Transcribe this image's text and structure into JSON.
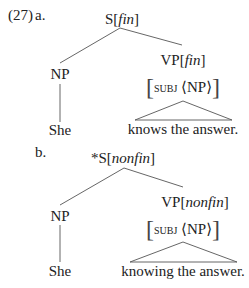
{
  "example": {
    "number": "(27)",
    "a": {
      "label": "a.",
      "root": {
        "cat": "S[",
        "feat": "fin",
        "close": "]"
      },
      "left": {
        "cat": "NP",
        "leaf": "She"
      },
      "right": {
        "cat": "VP[",
        "feat": "fin",
        "close": "]",
        "avm_attr": "subj",
        "avm_val": "⟨NP⟩",
        "leaf": "knows the answer."
      }
    },
    "b": {
      "label": "b.",
      "root": {
        "cat": "*S[",
        "feat": "nonfin",
        "close": "]"
      },
      "left": {
        "cat": "NP",
        "leaf": "She"
      },
      "right": {
        "cat": "VP[",
        "feat": "nonfin",
        "close": "]",
        "avm_attr": "subj",
        "avm_val": "⟨NP⟩",
        "leaf": "knowing the answer."
      }
    }
  }
}
